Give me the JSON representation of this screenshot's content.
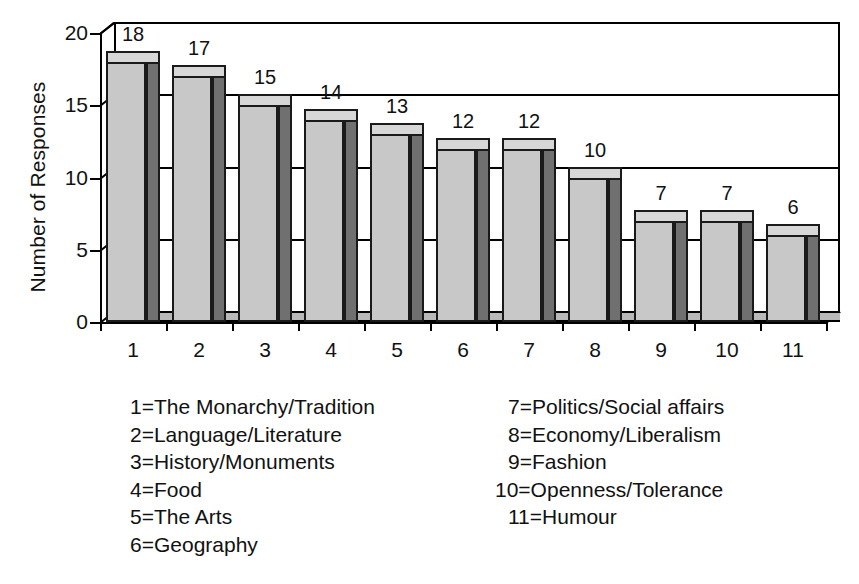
{
  "chart_data": {
    "type": "bar",
    "title": "",
    "xlabel": "",
    "ylabel": "Number of Responses",
    "categories": [
      "1",
      "2",
      "3",
      "4",
      "5",
      "6",
      "7",
      "8",
      "9",
      "10",
      "11"
    ],
    "values": [
      18,
      17,
      15,
      14,
      13,
      12,
      12,
      10,
      7,
      7,
      6
    ],
    "ylim": [
      0,
      20
    ],
    "yticks": [
      "0",
      "5",
      "10",
      "15",
      "20"
    ],
    "ytick_values": [
      0,
      5,
      10,
      15,
      20
    ],
    "grid": true,
    "gridlines_at": [
      5,
      10,
      15,
      20
    ],
    "legend_position": "below-plot",
    "style": "3d-bar",
    "bar_face_color": "#c8c8c8",
    "bar_side_color": "#707070",
    "bar_top_color": "#d7d7d7",
    "axis_color": "#000000",
    "data_labels": [
      "18",
      "17",
      "15",
      "14",
      "13",
      "12",
      "12",
      "10",
      "7",
      "7",
      "6"
    ]
  },
  "legend": {
    "left_column": [
      "1=The Monarchy/Tradition",
      "2=Language/Literature",
      "3=History/Monuments",
      "4=Food",
      "5=The Arts",
      "6=Geography"
    ],
    "right_column": [
      "7=Politics/Social affairs",
      "8=Economy/Liberalism",
      "9=Fashion",
      "10=Openness/Tolerance",
      "11=Humour"
    ]
  },
  "caption": {
    "text": ""
  }
}
